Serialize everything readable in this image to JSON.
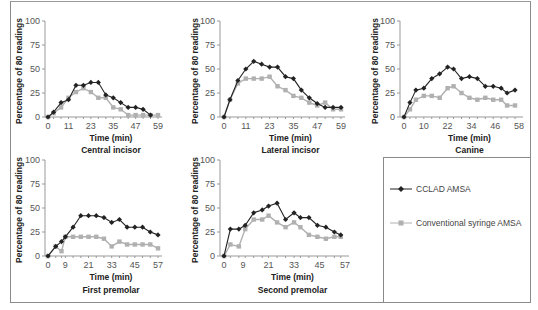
{
  "legend": {
    "series": [
      {
        "name": "CCLAD AMSA",
        "color": "#222222",
        "marker": "diamond"
      },
      {
        "name": "Conventional syringe AMSA",
        "color": "#b0b0b0",
        "marker": "square"
      }
    ]
  },
  "chart_data": [
    {
      "type": "line",
      "title": "Central incisor",
      "xlabel": "Time (min)",
      "ylabel": "Percentage of 80 readings",
      "ylim": [
        0,
        100
      ],
      "yticks": [
        0,
        25,
        50,
        75,
        100
      ],
      "xticks": [
        0,
        11,
        23,
        35,
        47,
        59
      ],
      "xlim": [
        0,
        59
      ],
      "grid": false,
      "x": [
        0,
        3,
        7,
        11,
        15,
        19,
        23,
        27,
        31,
        35,
        39,
        43,
        47,
        51,
        55,
        59
      ],
      "series": [
        {
          "name": "CCLAD AMSA",
          "values": [
            0,
            5,
            15,
            18,
            33,
            33,
            36,
            36,
            23,
            20,
            15,
            10,
            10,
            8,
            2,
            null
          ]
        },
        {
          "name": "Conventional syringe AMSA",
          "values": [
            0,
            4,
            10,
            20,
            26,
            30,
            26,
            20,
            20,
            10,
            8,
            2,
            2,
            2,
            2,
            2
          ]
        }
      ]
    },
    {
      "type": "line",
      "title": "Lateral incisor",
      "xlabel": "Time (min)",
      "ylabel": "Percentage of 80 readings",
      "ylim": [
        0,
        100
      ],
      "yticks": [
        0,
        25,
        50,
        75,
        100
      ],
      "xticks": [
        0,
        11,
        23,
        35,
        47,
        59
      ],
      "xlim": [
        0,
        59
      ],
      "grid": false,
      "x": [
        0,
        3,
        7,
        11,
        15,
        19,
        23,
        27,
        31,
        35,
        39,
        43,
        47,
        51,
        55,
        59
      ],
      "series": [
        {
          "name": "CCLAD AMSA",
          "values": [
            0,
            18,
            38,
            50,
            58,
            55,
            52,
            52,
            42,
            40,
            28,
            20,
            14,
            10,
            10,
            10
          ]
        },
        {
          "name": "Conventional syringe AMSA",
          "values": [
            0,
            18,
            35,
            40,
            40,
            40,
            42,
            32,
            28,
            22,
            20,
            15,
            12,
            15,
            8,
            8
          ]
        }
      ]
    },
    {
      "type": "line",
      "title": "Canine",
      "xlabel": "Time (min)",
      "ylabel": "Percentage of 80 readings",
      "ylim": [
        0,
        100
      ],
      "yticks": [
        0,
        25,
        50,
        75,
        100
      ],
      "xticks": [
        0,
        10,
        22,
        34,
        46,
        58
      ],
      "xlim": [
        0,
        58
      ],
      "grid": false,
      "x": [
        0,
        3,
        6,
        10,
        14,
        18,
        22,
        25,
        29,
        33,
        37,
        41,
        45,
        49,
        52,
        56
      ],
      "series": [
        {
          "name": "CCLAD AMSA",
          "values": [
            0,
            15,
            28,
            30,
            40,
            45,
            52,
            50,
            40,
            42,
            40,
            32,
            32,
            30,
            25,
            28
          ]
        },
        {
          "name": "Conventional syringe AMSA",
          "values": [
            0,
            8,
            18,
            22,
            22,
            20,
            30,
            32,
            25,
            20,
            18,
            20,
            18,
            18,
            12,
            12
          ]
        }
      ]
    },
    {
      "type": "line",
      "title": "First premolar",
      "xlabel": "Time (min)",
      "ylabel": "Percentage of 80 readings",
      "ylim": [
        0,
        100
      ],
      "yticks": [
        0,
        25,
        50,
        75,
        100
      ],
      "xticks": [
        0,
        9,
        21,
        33,
        45,
        57
      ],
      "xlim": [
        0,
        57
      ],
      "grid": false,
      "x": [
        0,
        4,
        7,
        9,
        13,
        17,
        21,
        25,
        29,
        33,
        37,
        41,
        45,
        49,
        53,
        57
      ],
      "series": [
        {
          "name": "CCLAD AMSA",
          "values": [
            0,
            10,
            15,
            20,
            30,
            42,
            42,
            42,
            40,
            35,
            38,
            30,
            30,
            30,
            25,
            22
          ]
        },
        {
          "name": "Conventional syringe AMSA",
          "values": [
            0,
            10,
            5,
            20,
            20,
            20,
            20,
            20,
            18,
            10,
            15,
            12,
            12,
            12,
            12,
            8
          ]
        }
      ]
    },
    {
      "type": "line",
      "title": "Second premolar",
      "xlabel": "Time (min)",
      "ylabel": "Percentage of 80 readings",
      "ylim": [
        0,
        100
      ],
      "yticks": [
        0,
        25,
        50,
        75,
        100
      ],
      "xticks": [
        0,
        9,
        21,
        33,
        45,
        57
      ],
      "xlim": [
        0,
        57
      ],
      "grid": false,
      "x": [
        0,
        3,
        7,
        10,
        14,
        18,
        21,
        25,
        29,
        33,
        36,
        40,
        44,
        48,
        52,
        55
      ],
      "series": [
        {
          "name": "CCLAD AMSA",
          "values": [
            0,
            28,
            28,
            32,
            45,
            48,
            52,
            55,
            38,
            45,
            40,
            40,
            32,
            30,
            25,
            22
          ]
        },
        {
          "name": "Conventional syringe AMSA",
          "values": [
            0,
            12,
            10,
            28,
            38,
            38,
            42,
            35,
            30,
            35,
            30,
            22,
            20,
            18,
            20,
            20
          ]
        }
      ]
    }
  ]
}
